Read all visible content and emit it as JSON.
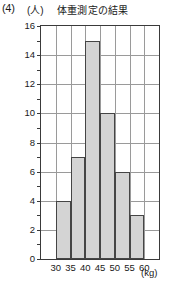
{
  "question_number": "(4)",
  "y_axis_unit": "(人)",
  "x_axis_unit": "(kg)",
  "chart_data": {
    "type": "bar",
    "title": "体重測定の結果",
    "xlabel": "(kg)",
    "ylabel": "(人)",
    "categories": [
      "30-35",
      "35-40",
      "40-45",
      "45-50",
      "50-55",
      "55-60"
    ],
    "values": [
      4,
      7,
      15,
      10,
      6,
      3
    ],
    "bin_edges": [
      30,
      35,
      40,
      45,
      50,
      55,
      60
    ],
    "x_tick_labels": [
      "30",
      "35",
      "40",
      "45",
      "50",
      "55",
      "60"
    ],
    "y_tick_labels": [
      "0",
      "2",
      "4",
      "6",
      "8",
      "10",
      "12",
      "14",
      "16"
    ],
    "xlim": [
      25,
      65
    ],
    "ylim": [
      0,
      16
    ],
    "y_major_step": 2,
    "y_minor_step": 1,
    "x_step": 5,
    "grid": true,
    "legend": false,
    "bar_fill_color": "#d4d4d4",
    "bar_edge_color": "#454545",
    "grid_color": "#9a9a9a",
    "axis_color": "#3a3a3a",
    "columns_total": 8,
    "bar_start_column": 2
  }
}
